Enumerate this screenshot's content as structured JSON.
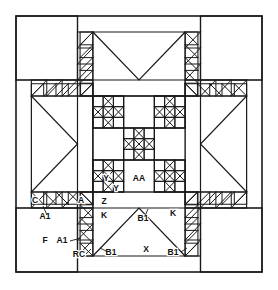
{
  "diagram": {
    "kind": "quilt-block-pattern",
    "background_color": "#ffffff",
    "line_color": "#1a1a1a",
    "block": {
      "outer_left": 16,
      "outer_top": 16,
      "outer_right": 262,
      "outer_bottom": 272,
      "grid_units": 16,
      "center_left": 90,
      "center_top": 90,
      "center_right": 188,
      "center_bottom": 188
    }
  },
  "labels": [
    {
      "id": "c",
      "text": "C",
      "x": 35,
      "y": 203
    },
    {
      "id": "a1-top",
      "text": "A1",
      "x": 45,
      "y": 219
    },
    {
      "id": "a",
      "text": "A",
      "x": 81,
      "y": 203
    },
    {
      "id": "z",
      "text": "Z",
      "x": 104,
      "y": 204
    },
    {
      "id": "k-left",
      "text": "K",
      "x": 104,
      "y": 218
    },
    {
      "id": "k-right",
      "text": "K",
      "x": 173,
      "y": 216
    },
    {
      "id": "b1-mid",
      "text": "B1",
      "x": 143,
      "y": 221
    },
    {
      "id": "aa",
      "text": "AA",
      "x": 139,
      "y": 181
    },
    {
      "id": "y-left",
      "text": "Y",
      "x": 106,
      "y": 181
    },
    {
      "id": "y-low",
      "text": "Y",
      "x": 116,
      "y": 191
    },
    {
      "id": "f",
      "text": "F",
      "x": 45,
      "y": 243
    },
    {
      "id": "a1-bot",
      "text": "A1",
      "x": 62,
      "y": 243
    },
    {
      "id": "rc",
      "text": "RC",
      "x": 79,
      "y": 257
    },
    {
      "id": "b1-left",
      "text": "B1",
      "x": 111,
      "y": 255
    },
    {
      "id": "x",
      "text": "X",
      "x": 146,
      "y": 252
    },
    {
      "id": "b1-right",
      "text": "B1",
      "x": 173,
      "y": 255
    }
  ],
  "leaders": [
    {
      "id": "leader-a1-top",
      "x1": 47,
      "y1": 215,
      "x2": 43,
      "y2": 206
    },
    {
      "id": "leader-a1-bot",
      "x1": 70,
      "y1": 241,
      "x2": 81,
      "y2": 238
    },
    {
      "id": "leader-rc",
      "x1": 86,
      "y1": 254,
      "x2": 91,
      "y2": 249
    },
    {
      "id": "leader-b1-left",
      "x1": 108,
      "y1": 252,
      "x2": 100,
      "y2": 248
    },
    {
      "id": "leader-b1-right",
      "x1": 181,
      "y1": 252,
      "x2": 187,
      "y2": 248
    },
    {
      "id": "leader-b1-mid",
      "x1": 145,
      "y1": 216,
      "x2": 148,
      "y2": 209
    }
  ],
  "legend_keys": [
    "C",
    "A",
    "A1",
    "Z",
    "K",
    "AA",
    "Y",
    "F",
    "RC",
    "B1",
    "X"
  ]
}
